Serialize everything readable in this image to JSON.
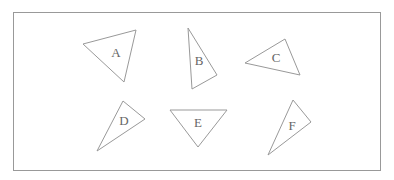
{
  "frame": {
    "x": 13,
    "y": 12,
    "width": 367,
    "height": 158,
    "stroke": "#999"
  },
  "triangles": [
    {
      "label": "A",
      "points": "83,44 136,30 124,82",
      "lx": 116,
      "ly": 57
    },
    {
      "label": "B",
      "points": "188,28 217,75 192,89",
      "lx": 199,
      "ly": 65
    },
    {
      "label": "C",
      "points": "245,63 285,39 300,75",
      "lx": 276,
      "ly": 62
    },
    {
      "label": "D",
      "points": "123,101 145,119 97,151",
      "lx": 124,
      "ly": 125
    },
    {
      "label": "E",
      "points": "170,110 227,110 198,147",
      "lx": 198,
      "ly": 127
    },
    {
      "label": "F",
      "points": "293,100 311,122 268,155",
      "lx": 292,
      "ly": 130
    }
  ]
}
